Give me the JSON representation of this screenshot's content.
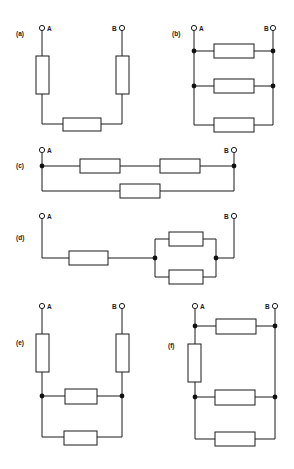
{
  "figure": {
    "circuits": [
      {
        "id": "a",
        "label": "(a)",
        "terminal_a": "A",
        "terminal_b": "B",
        "topology": "three resistors in series (U-shape)",
        "resistor_count": 3
      },
      {
        "id": "b",
        "label": "(b)",
        "terminal_a": "A",
        "terminal_b": "B",
        "topology": "three resistors in parallel",
        "resistor_count": 3
      },
      {
        "id": "c",
        "label": "(c)",
        "terminal_a": "A",
        "terminal_b": "B",
        "topology": "two series resistors in parallel with one resistor",
        "resistor_count": 3
      },
      {
        "id": "d",
        "label": "(d)",
        "terminal_a": "A",
        "terminal_b": "B",
        "topology": "one resistor in series with two parallel resistors",
        "resistor_count": 3
      },
      {
        "id": "e",
        "label": "(e)",
        "terminal_a": "A",
        "terminal_b": "B",
        "topology": "two series resistors with two parallel resistors between",
        "resistor_count": 4
      },
      {
        "id": "f",
        "label": "(f)",
        "terminal_a": "A",
        "terminal_b": "B",
        "topology": "bridge-like network with four resistors",
        "resistor_count": 4
      }
    ]
  }
}
